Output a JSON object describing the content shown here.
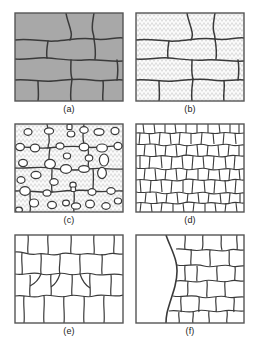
{
  "figure": {
    "title": "",
    "background_color": "#ffffff",
    "panel_count": 6,
    "panel_width": 110,
    "panel_height": 90,
    "line_color": "#3a3a3a",
    "frame_color": "#555555"
  },
  "panels": [
    {
      "id": "a",
      "caption": "(a)",
      "fill_name": "solid-gray",
      "fill_color": "#a8a8a8",
      "description": "coarse equiaxed grains, solid gray fill",
      "grain_count": 12,
      "grain_scale": "coarse"
    },
    {
      "id": "b",
      "caption": "(b)",
      "fill_name": "stipple",
      "fill_color": "#f2f2f2",
      "description": "same coarse grain structure with stippled fill",
      "grain_count": 12,
      "grain_scale": "coarse"
    },
    {
      "id": "c",
      "caption": "(c)",
      "fill_name": "stipple",
      "fill_color": "#f2f2f2",
      "description": "grain boundaries decorated with elliptical precipitate particles",
      "grain_count": 9,
      "particle_count": 38,
      "grain_scale": "coarse"
    },
    {
      "id": "d",
      "caption": "(d)",
      "fill_name": "none",
      "fill_color": "#ffffff",
      "description": "fine equiaxed grains, outline only",
      "grain_count": 95,
      "grain_scale": "fine"
    },
    {
      "id": "e",
      "caption": "(e)",
      "fill_name": "none",
      "fill_color": "#ffffff",
      "description": "medium polygonal grains, outline only",
      "grain_count": 34,
      "grain_scale": "medium"
    },
    {
      "id": "f",
      "caption": "(f)",
      "fill_name": "none",
      "fill_color": "#ffffff",
      "description": "one large grain on the left advancing into a field of small grains on the right",
      "grain_count": 28,
      "grain_scale": "mixed"
    }
  ]
}
